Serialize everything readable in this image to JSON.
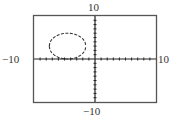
{
  "chart_data": {
    "type": "line",
    "title": "",
    "xlabel": "",
    "ylabel": "",
    "xlim": [
      -10,
      10
    ],
    "ylim": [
      -10,
      10
    ],
    "xscale": 1,
    "yscale": 1,
    "grid": false,
    "tick_labels": {
      "xmin": "−10",
      "xmax": "10",
      "ymin": "−10",
      "ymax": "10"
    },
    "series": [
      {
        "name": "circle",
        "shape": "circle",
        "style": "dashed",
        "center": [
          -4.5,
          3
        ],
        "radius": 3
      }
    ]
  },
  "window": {
    "xmin_label": "−10",
    "xmax_label": "10",
    "ymin_label": "−10",
    "ymax_label": "10"
  },
  "colors": {
    "frame": "#555555",
    "axis": "#222222",
    "curve": "#333333",
    "text": "#333333",
    "background": "#ffffff"
  }
}
